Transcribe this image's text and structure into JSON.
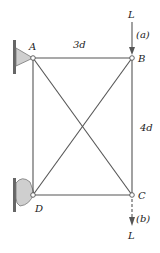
{
  "diagram": {
    "type": "truss",
    "nodes": {
      "A": {
        "label": "A"
      },
      "B": {
        "label": "B"
      },
      "C": {
        "label": "C"
      },
      "D": {
        "label": "D"
      }
    },
    "dimensions": {
      "horizontal": "3d",
      "vertical": "4d"
    },
    "loads": {
      "a": {
        "label": "L",
        "case": "(a)",
        "direction": "down",
        "node": "B"
      },
      "b": {
        "label": "L",
        "case": "(b)",
        "direction": "down",
        "node": "C"
      }
    },
    "colors": {
      "member": "#555555",
      "support_fill": "#cfcfcf",
      "wall": "#666666"
    }
  }
}
